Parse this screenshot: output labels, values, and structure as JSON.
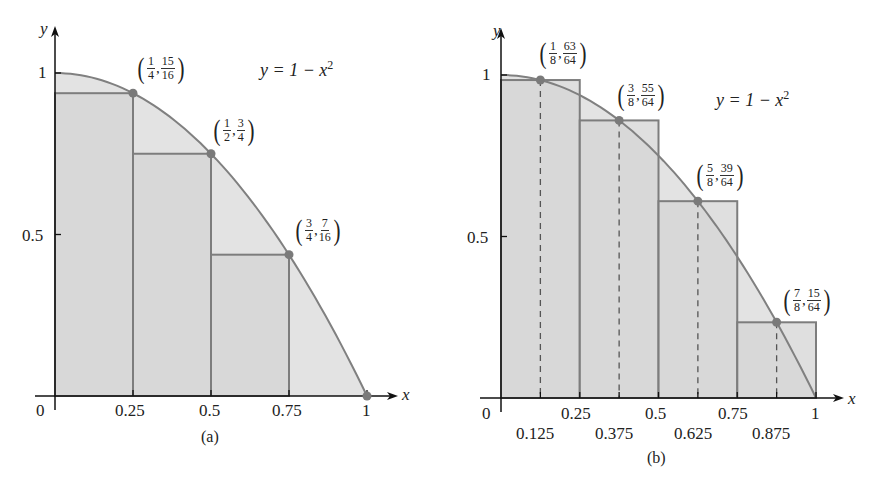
{
  "chart_data": [
    {
      "type": "bar",
      "subtype": "riemann-sum-left-endpoint-rectangles-with-curve",
      "caption": "(a)",
      "curve": "y = 1 - x^2",
      "xlabel": "x",
      "ylabel": "y",
      "x_ticks": [
        "0",
        "0.25",
        "0.5",
        "0.75",
        "1"
      ],
      "y_ticks": [
        "0.5",
        "1"
      ],
      "xlim": [
        0,
        1
      ],
      "ylim": [
        0,
        1
      ],
      "intervals": [
        [
          0,
          0.25
        ],
        [
          0.25,
          0.5
        ],
        [
          0.5,
          0.75
        ],
        [
          0.75,
          1
        ]
      ],
      "categories": [
        "[0,0.25]",
        "[0.25,0.5]",
        "[0.5,0.75]",
        "[0.75,1]"
      ],
      "values": [
        0.9375,
        0.75,
        0.4375,
        0
      ],
      "points": [
        {
          "x": 0.25,
          "y": 0.9375,
          "label_x": {
            "n": "1",
            "d": "4"
          },
          "label_y": {
            "n": "15",
            "d": "16"
          }
        },
        {
          "x": 0.5,
          "y": 0.75,
          "label_x": {
            "n": "1",
            "d": "2"
          },
          "label_y": {
            "n": "3",
            "d": "4"
          }
        },
        {
          "x": 0.75,
          "y": 0.4375,
          "label_x": {
            "n": "3",
            "d": "4"
          },
          "label_y": {
            "n": "7",
            "d": "16"
          }
        },
        {
          "x": 1,
          "y": 0
        }
      ],
      "grid": false,
      "legend": null
    },
    {
      "type": "bar",
      "subtype": "riemann-sum-midpoint-rectangles-with-curve",
      "caption": "(b)",
      "curve": "y = 1 - x^2",
      "xlabel": "x",
      "ylabel": "y",
      "x_ticks": [
        "0",
        "0.25",
        "0.5",
        "0.75",
        "1"
      ],
      "x_ticks_secondary": [
        "0.125",
        "0.375",
        "0.625",
        "0.875"
      ],
      "y_ticks": [
        "0.5",
        "1"
      ],
      "xlim": [
        0,
        1
      ],
      "ylim": [
        0,
        1
      ],
      "intervals": [
        [
          0,
          0.25
        ],
        [
          0.25,
          0.5
        ],
        [
          0.5,
          0.75
        ],
        [
          0.75,
          1
        ]
      ],
      "categories": [
        "[0,0.25]",
        "[0.25,0.5]",
        "[0.5,0.75]",
        "[0.75,1]"
      ],
      "values": [
        0.984375,
        0.859375,
        0.609375,
        0.234375
      ],
      "points": [
        {
          "x": 0.125,
          "y": 0.984375,
          "label_x": {
            "n": "1",
            "d": "8"
          },
          "label_y": {
            "n": "63",
            "d": "64"
          }
        },
        {
          "x": 0.375,
          "y": 0.859375,
          "label_x": {
            "n": "3",
            "d": "8"
          },
          "label_y": {
            "n": "55",
            "d": "64"
          }
        },
        {
          "x": 0.625,
          "y": 0.609375,
          "label_x": {
            "n": "5",
            "d": "8"
          },
          "label_y": {
            "n": "39",
            "d": "64"
          }
        },
        {
          "x": 0.875,
          "y": 0.234375,
          "label_x": {
            "n": "7",
            "d": "8"
          },
          "label_y": {
            "n": "15",
            "d": "64"
          }
        }
      ],
      "dashed_midlines": true,
      "grid": false,
      "legend": null
    }
  ],
  "labels": {
    "a": {
      "y_axis": "y",
      "x_axis": "x",
      "eq_lhs": "y = 1 − x",
      "eq_exp": "2",
      "tick_0": "0",
      "tick_025": "0.25",
      "tick_05": "0.5",
      "tick_075": "0.75",
      "tick_1": "1",
      "ytick_05": "0.5",
      "ytick_1": "1",
      "caption": "(a)"
    },
    "b": {
      "y_axis": "y",
      "x_axis": "x",
      "eq_lhs": "y = 1 − x",
      "eq_exp": "2",
      "tick_0": "0",
      "tick_025": "0.25",
      "tick_05": "0.5",
      "tick_075": "0.75",
      "tick_1": "1",
      "tick_0125": "0.125",
      "tick_0375": "0.375",
      "tick_0625": "0.625",
      "tick_0875": "0.875",
      "ytick_05": "0.5",
      "ytick_1": "1",
      "caption": "(b)"
    }
  },
  "colors": {
    "background": "#ffffff",
    "under_curve_fill": "#e3e3e3",
    "rect_fill": "#d4d4d4",
    "rect_stroke": "#7d7d7d",
    "curve": "#808080",
    "points": "#7a7a7a",
    "axis": "#111111"
  }
}
